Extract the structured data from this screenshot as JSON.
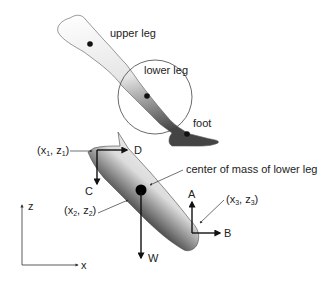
{
  "labels": {
    "upper_leg": "upper leg",
    "lower_leg": "lower leg",
    "foot": "foot",
    "center_of_mass": "center of mass of lower leg",
    "point1": {
      "x": "x",
      "x_sub": "1",
      "z": "z",
      "z_sub": "1"
    },
    "point2": {
      "x": "x",
      "x_sub": "2",
      "z": "z",
      "z_sub": "2"
    },
    "point3": {
      "x": "x",
      "x_sub": "3",
      "z": "z",
      "z_sub": "3"
    },
    "force_A": "A",
    "force_B": "B",
    "force_C": "C",
    "force_D": "D",
    "force_W": "W",
    "axis_z": "z",
    "axis_x": "x"
  },
  "colors": {
    "ink": "#222222",
    "line": "#333333",
    "limb_light": "#eeeeee",
    "limb_dark": "#555555"
  }
}
